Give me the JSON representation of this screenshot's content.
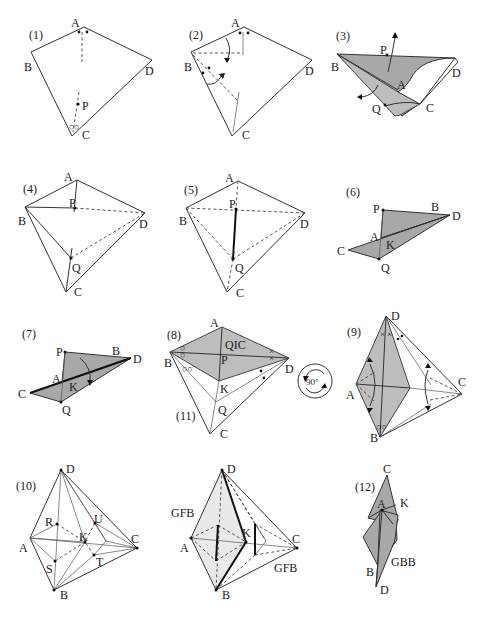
{
  "figure": {
    "steps": [
      {
        "id": "1",
        "label": "(1)",
        "vertices": [
          "A",
          "B",
          "C",
          "D",
          "P"
        ]
      },
      {
        "id": "2",
        "label": "(2)",
        "vertices": [
          "A",
          "B",
          "C",
          "D"
        ]
      },
      {
        "id": "3",
        "label": "(3)",
        "vertices": [
          "B",
          "P",
          "A",
          "Q",
          "C",
          "D"
        ]
      },
      {
        "id": "4",
        "label": "(4)",
        "vertices": [
          "A",
          "B",
          "P",
          "D",
          "Q",
          "C"
        ]
      },
      {
        "id": "5",
        "label": "(5)",
        "vertices": [
          "A",
          "B",
          "P",
          "D",
          "Q",
          "C"
        ]
      },
      {
        "id": "6",
        "label": "(6)",
        "vertices": [
          "P",
          "B",
          "D",
          "A",
          "K",
          "C",
          "Q"
        ]
      },
      {
        "id": "7",
        "label": "(7)",
        "vertices": [
          "P",
          "B",
          "D",
          "A",
          "K",
          "C",
          "Q"
        ]
      },
      {
        "id": "8",
        "label": "(8)",
        "sublabel": "(11)",
        "vertices": [
          "A",
          "B",
          "P",
          "D",
          "K",
          "Q",
          "C"
        ],
        "region_label": "QIC"
      },
      {
        "id": "9",
        "label": "(9)",
        "vertices": [
          "D",
          "A",
          "C",
          "B"
        ]
      },
      {
        "id": "10",
        "label": "(10)",
        "vertices": [
          "D",
          "R",
          "U",
          "A",
          "K",
          "C",
          "S",
          "T",
          "B"
        ]
      },
      {
        "id": "11",
        "label": "",
        "vertices": [
          "D",
          "A",
          "K",
          "C",
          "B"
        ],
        "region_labels": [
          "GFB",
          "GFB"
        ]
      },
      {
        "id": "12",
        "label": "(12)",
        "vertices": [
          "C",
          "A",
          "K",
          "B",
          "D"
        ],
        "region_label": "GBB"
      }
    ],
    "rotation_symbol": {
      "label": "90°"
    }
  },
  "labels": {
    "s1": {
      "step": "(1)",
      "A": "A",
      "B": "B",
      "C": "C",
      "D": "D",
      "P": "P"
    },
    "s2": {
      "step": "(2)",
      "A": "A",
      "B": "B",
      "C": "C",
      "D": "D"
    },
    "s3": {
      "step": "(3)",
      "B": "B",
      "P": "P",
      "A": "A",
      "Q": "Q",
      "C": "C",
      "D": "D"
    },
    "s4": {
      "step": "(4)",
      "A": "A",
      "B": "B",
      "P": "P",
      "D": "D",
      "Q": "Q",
      "C": "C"
    },
    "s5": {
      "step": "(5)",
      "A": "A",
      "B": "B",
      "P": "P",
      "D": "D",
      "Q": "Q",
      "C": "C"
    },
    "s6": {
      "step": "(6)",
      "P": "P",
      "B": "B",
      "D": "D",
      "A": "A",
      "K": "K",
      "C": "C",
      "Q": "Q"
    },
    "s7": {
      "step": "(7)",
      "P": "P",
      "B": "B",
      "D": "D",
      "A": "A",
      "K": "K",
      "C": "C",
      "Q": "Q"
    },
    "s8": {
      "step": "(8)",
      "sub": "(11)",
      "A": "A",
      "B": "B",
      "P": "P",
      "D": "D",
      "K": "K",
      "Q": "Q",
      "C": "C",
      "region": "QIC"
    },
    "rot": {
      "text": "90°"
    },
    "s9": {
      "step": "(9)",
      "D": "D",
      "A": "A",
      "C": "C",
      "B": "B"
    },
    "s10": {
      "step": "(10)",
      "D": "D",
      "R": "R",
      "U": "U",
      "A": "A",
      "K": "K",
      "C": "C",
      "S": "S",
      "T": "T",
      "B": "B"
    },
    "s11": {
      "D": "D",
      "A": "A",
      "K": "K",
      "C": "C",
      "B": "B",
      "gfb1": "GFB",
      "gfb2": "GFB"
    },
    "s12": {
      "step": "(12)",
      "C": "C",
      "A": "A",
      "K": "K",
      "B": "B",
      "D": "D",
      "gbb": "GBB"
    }
  }
}
